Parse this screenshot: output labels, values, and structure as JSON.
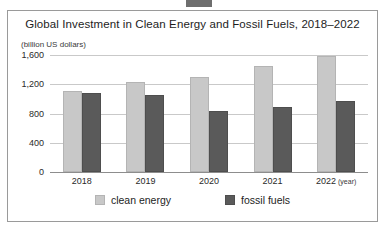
{
  "chart_data": {
    "type": "bar",
    "title": "Global Investment in Clean Energy and Fossil Fuels, 2018–2022",
    "units_label": "(billion US dollars)",
    "categories": [
      "2018",
      "2019",
      "2020",
      "2021",
      "2022"
    ],
    "xlabel": "(year)",
    "ylabel": "",
    "ylim": [
      0,
      1600
    ],
    "yticks": [
      0,
      400,
      800,
      1200,
      1600
    ],
    "ytick_labels": [
      "0",
      "400",
      "800",
      "1,200",
      "1,600"
    ],
    "grid": true,
    "legend_position": "bottom",
    "series": [
      {
        "name": "clean energy",
        "color": "#c8c8c8",
        "values": [
          1110,
          1230,
          1300,
          1450,
          1590
        ]
      },
      {
        "name": "fossil fuels",
        "color": "#5a5a5a",
        "values": [
          1080,
          1050,
          830,
          890,
          970
        ]
      }
    ]
  },
  "legend": {
    "items": [
      {
        "label": "clean energy"
      },
      {
        "label": "fossil fuels"
      }
    ]
  },
  "axis": {
    "x_last_suffix": "(year)"
  }
}
